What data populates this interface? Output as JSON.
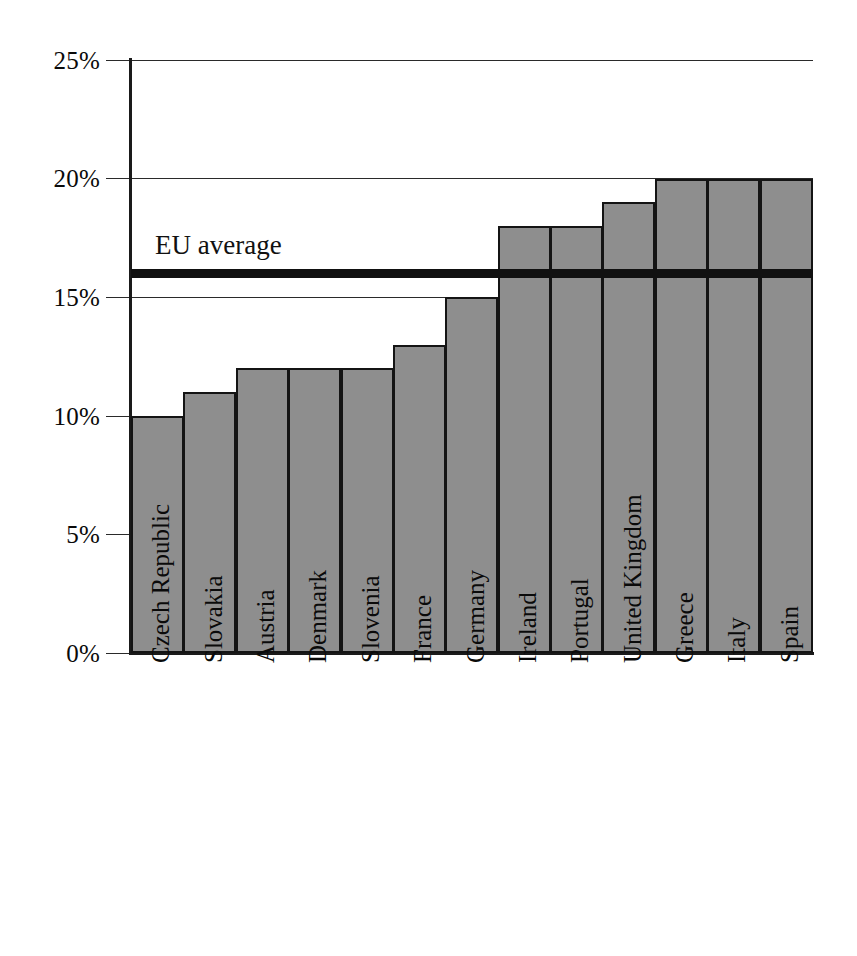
{
  "chart_data": {
    "type": "bar",
    "title": "",
    "subtitle": "",
    "xlabel": "",
    "ylabel": "",
    "ylim": [
      0,
      25
    ],
    "y_unit": "%",
    "grid": true,
    "legend_position": "none",
    "categories": [
      "Czech Republic",
      "Slovakia",
      "Austria",
      "Denmark",
      "Slovenia",
      "France",
      "Germany",
      "Ireland",
      "Portugal",
      "United Kingdom",
      "Greece",
      "Italy",
      "Spain"
    ],
    "values": [
      10,
      11,
      12,
      12,
      12,
      13,
      15,
      18,
      18,
      19,
      20,
      20,
      20
    ],
    "y_ticks": [
      0,
      5,
      10,
      15,
      20,
      25
    ],
    "y_tick_labels": [
      "0%",
      "5%",
      "10%",
      "15%",
      "20%",
      "25%"
    ],
    "annotations": [
      {
        "name": "eu-average",
        "label": "EU average",
        "value": 16,
        "style": "horizontal-rule"
      }
    ],
    "colors": {
      "bar_fill": "#8e8e8e",
      "bar_stroke": "#141414",
      "gridline": "#2a2a2a",
      "axis": "#1a1a1a",
      "annotation_line": "#111111",
      "text": "#0a0a0a",
      "background": "#ffffff"
    }
  }
}
